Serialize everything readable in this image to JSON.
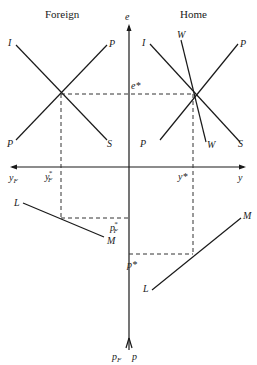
{
  "panels": {
    "foreign": {
      "title": "Foreign"
    },
    "home": {
      "title": "Home"
    }
  },
  "axes": {
    "vertical_top": "e",
    "vertical_bottom_left": "p",
    "vertical_bottom_left_sub": "F",
    "vertical_bottom_right": "p",
    "horizontal_right": "y",
    "horizontal_left": "y",
    "horizontal_left_sub": "F"
  },
  "curves": {
    "foreign": {
      "upper_left": "I",
      "upper_right": "P",
      "lower_left": "P",
      "lower_right": "S",
      "money_left": "L",
      "money_right": "M"
    },
    "home": {
      "upper_left": "I",
      "upper_mid": "W",
      "upper_right": "P",
      "lower_left": "P",
      "lower_mid": "W",
      "lower_right": "S",
      "money_left": "L",
      "money_right": "M"
    }
  },
  "equilibrium": {
    "e_star": "e*",
    "y_star": "y*",
    "y_F_star": "y",
    "y_F_star_sub": "F",
    "y_F_star_sup": "*",
    "p_star": "p*",
    "p_F_star": "p",
    "p_F_star_sub": "F",
    "p_F_star_sup": "*"
  }
}
